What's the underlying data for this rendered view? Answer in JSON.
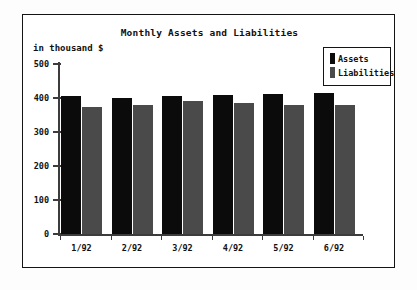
{
  "chart_data": {
    "type": "bar",
    "title": "Monthly Assets and Liabilities",
    "xlabel": "",
    "ylabel": "in thousand $",
    "categories": [
      "1/92",
      "2/92",
      "3/92",
      "4/92",
      "5/92",
      "6/92"
    ],
    "series": [
      {
        "name": "Assets",
        "values": [
          405,
          400,
          405,
          408,
          412,
          415
        ],
        "color": "#0b0b0b"
      },
      {
        "name": "Liabilities",
        "values": [
          373,
          378,
          390,
          385,
          378,
          380
        ],
        "color": "#4a4a4a"
      }
    ],
    "ylim": [
      0,
      500
    ],
    "yticks": [
      0,
      100,
      200,
      300,
      400,
      500
    ],
    "ytick_labels": [
      "0",
      "100",
      "200",
      "300",
      "400",
      "500"
    ],
    "grid": false,
    "legend_position": "top-right",
    "legend_entries": [
      "Assets",
      "Liabilities"
    ]
  },
  "frame": {
    "border_color": "#141414",
    "background": "#ffffff"
  }
}
